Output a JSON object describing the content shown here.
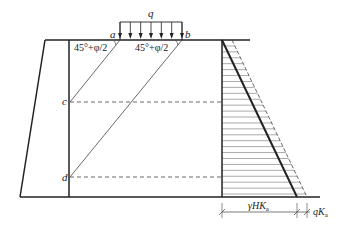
{
  "figure": {
    "type": "earth-pressure-diagram",
    "labels": {
      "load": "q",
      "point_a": "a",
      "point_b": "b",
      "point_c": "c",
      "point_d": "d",
      "angle_left": "45°+φ/2",
      "angle_right": "45°+φ/2",
      "dim_soil": "γHK",
      "dim_soil_sub": "a",
      "dim_surcharge": "qK",
      "dim_surcharge_sub": "a"
    },
    "colors": {
      "line": "#222222",
      "thin": "#444444"
    },
    "load_arrow_count": 7,
    "hatch_line_count": 26
  }
}
